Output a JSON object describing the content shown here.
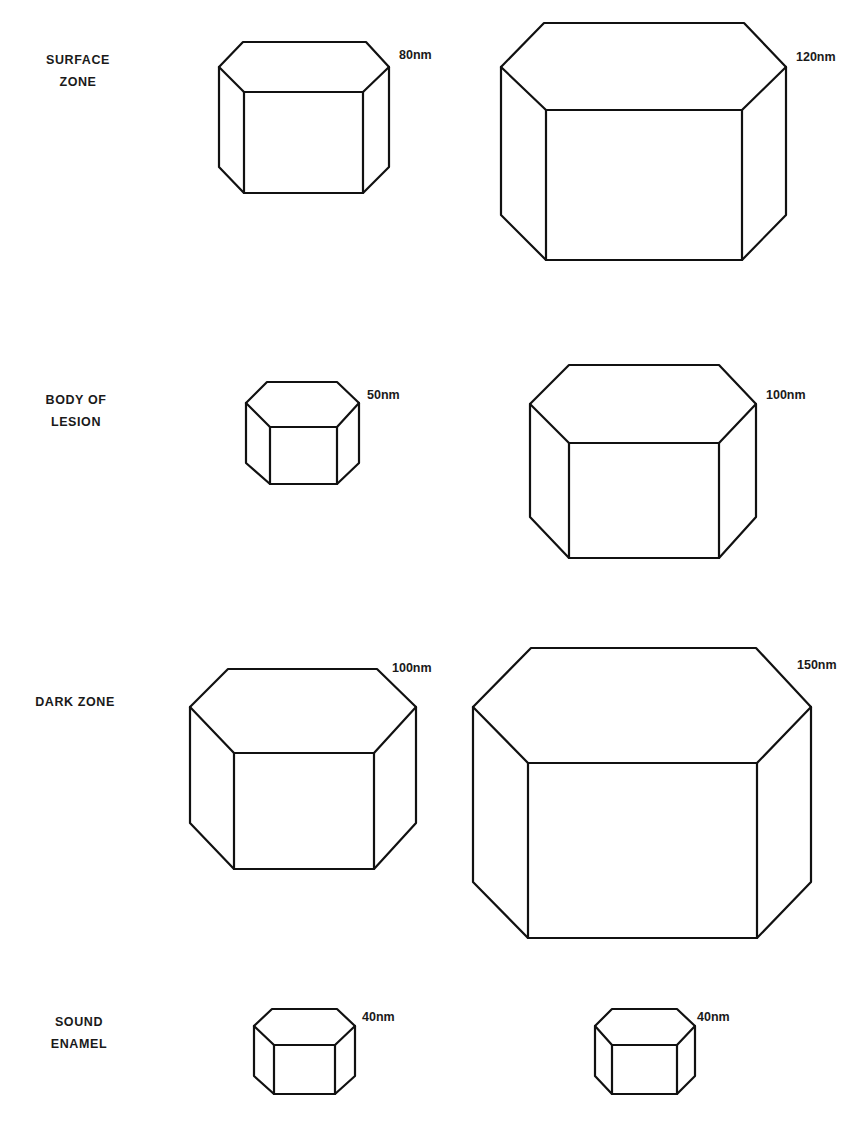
{
  "figure": {
    "background": "#ffffff",
    "line_color": "#111111",
    "rows": [
      {
        "zone": "SURFACE ZONE",
        "zone_lines": [
          "SURFACE",
          "ZONE"
        ],
        "label_pos": {
          "cx": 78,
          "top": 49
        },
        "crystals": [
          {
            "size_label": "80nm",
            "label_pos": {
              "x": 399,
              "y": 48
            },
            "geom": {
              "topY": 42,
              "topL": 243,
              "topR": 366,
              "midY": 67,
              "leftX": 219,
              "rightX": 389,
              "frontTopY": 92,
              "frontL": 244,
              "frontR": 363,
              "sideBotY": 167,
              "botY": 193
            }
          },
          {
            "size_label": "120nm",
            "label_pos": {
              "x": 796,
              "y": 50
            },
            "geom": {
              "topY": 23,
              "topL": 544,
              "topR": 744,
              "midY": 67,
              "leftX": 501,
              "rightX": 786,
              "frontTopY": 110,
              "frontL": 546,
              "frontR": 742,
              "sideBotY": 215,
              "botY": 260
            }
          }
        ]
      },
      {
        "zone": "BODY OF LESION",
        "zone_lines": [
          "BODY  OF",
          "LESION"
        ],
        "label_pos": {
          "cx": 76,
          "top": 389
        },
        "crystals": [
          {
            "size_label": "50nm",
            "label_pos": {
              "x": 367,
              "y": 388
            },
            "geom": {
              "topY": 382,
              "topL": 267,
              "topR": 337,
              "midY": 403,
              "leftX": 246,
              "rightX": 359,
              "frontTopY": 427,
              "frontL": 270,
              "frontR": 337,
              "sideBotY": 463,
              "botY": 484
            }
          },
          {
            "size_label": "100nm",
            "label_pos": {
              "x": 766,
              "y": 388
            },
            "geom": {
              "topY": 365,
              "topL": 569,
              "topR": 719,
              "midY": 404,
              "leftX": 530,
              "rightX": 756,
              "frontTopY": 443,
              "frontL": 569,
              "frontR": 719,
              "sideBotY": 517,
              "botY": 558
            }
          }
        ]
      },
      {
        "zone": "DARK ZONE",
        "zone_lines": [
          "DARK  ZONE"
        ],
        "label_pos": {
          "cx": 75,
          "top": 691
        },
        "crystals": [
          {
            "size_label": "100nm",
            "label_pos": {
              "x": 392,
              "y": 661
            },
            "geom": {
              "topY": 669,
              "topL": 228,
              "topR": 377,
              "midY": 707,
              "leftX": 190,
              "rightX": 416,
              "frontTopY": 753,
              "frontL": 234,
              "frontR": 374,
              "sideBotY": 823,
              "botY": 869
            }
          },
          {
            "size_label": "150nm",
            "label_pos": {
              "x": 797,
              "y": 658
            },
            "geom": {
              "topY": 648,
              "topL": 531,
              "topR": 756,
              "midY": 707,
              "leftX": 473,
              "rightX": 811,
              "frontTopY": 763,
              "frontL": 528,
              "frontR": 757,
              "sideBotY": 882,
              "botY": 938
            }
          }
        ]
      },
      {
        "zone": "SOUND ENAMEL",
        "zone_lines": [
          "SOUND",
          "ENAMEL"
        ],
        "label_pos": {
          "cx": 79,
          "top": 1011
        },
        "crystals": [
          {
            "size_label": "40nm",
            "label_pos": {
              "x": 362,
              "y": 1010
            },
            "geom": {
              "topY": 1009,
              "topL": 272,
              "topR": 337,
              "midY": 1026,
              "leftX": 254,
              "rightX": 355,
              "frontTopY": 1045,
              "frontL": 274,
              "frontR": 335,
              "sideBotY": 1076,
              "botY": 1094
            }
          },
          {
            "size_label": "40nm",
            "label_pos": {
              "x": 697,
              "y": 1010
            },
            "geom": {
              "topY": 1009,
              "topL": 612,
              "topR": 677,
              "midY": 1026,
              "leftX": 595,
              "rightX": 695,
              "frontTopY": 1045,
              "frontL": 612,
              "frontR": 677,
              "sideBotY": 1076,
              "botY": 1094
            }
          }
        ]
      }
    ]
  }
}
